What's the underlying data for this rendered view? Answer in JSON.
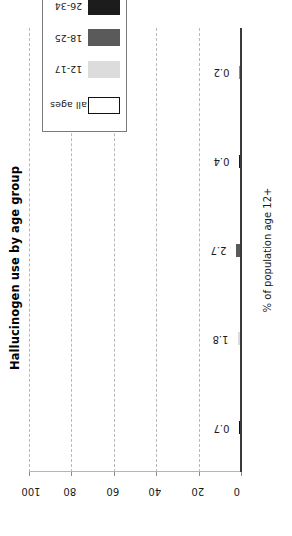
{
  "chart_data": {
    "type": "bar",
    "title": "Hallucinogen use by age group",
    "xlabel": "",
    "ylabel": "% of population age 12+",
    "orientation": "vertical-rotated",
    "categories": [
      "all ages",
      "12-17",
      "18-25",
      "26-34",
      "35+"
    ],
    "values": [
      0.7,
      1.8,
      2.7,
      0.4,
      0.2
    ],
    "value_labels": [
      "0.7",
      "1.8",
      "2.7",
      "0.4",
      "0.2"
    ],
    "ylim": [
      0,
      100
    ],
    "yticks": [
      0,
      20,
      40,
      60,
      80,
      100
    ],
    "ytick_labels": [
      "0",
      "20",
      "40",
      "60",
      "80",
      "100"
    ],
    "grid": true,
    "grid_style": "dashed",
    "legend_position": "top-right",
    "series": [
      {
        "name": "all ages",
        "value": 0.7,
        "color": "#ffffff",
        "edge": "#111111"
      },
      {
        "name": "12-17",
        "value": 1.8,
        "color": "#dcdcdc",
        "edge": "#dcdcdc"
      },
      {
        "name": "18-25",
        "value": 2.7,
        "color": "#5a5a5a",
        "edge": "#5a5a5a"
      },
      {
        "name": "26-34",
        "value": 0.4,
        "color": "#1c1c1c",
        "edge": "#1c1c1c"
      },
      {
        "name": "35+",
        "value": 0.2,
        "color": "#8e8e8e",
        "edge": "#8e8e8e"
      }
    ]
  },
  "legend": {
    "entries": [
      {
        "label": "all ages",
        "color": "#ffffff",
        "edge": "#111111"
      },
      {
        "label": "12-17",
        "color": "#dcdcdc",
        "edge": "#dcdcdc"
      },
      {
        "label": "18-25",
        "color": "#5a5a5a",
        "edge": "#5a5a5a"
      },
      {
        "label": "26-34",
        "color": "#1c1c1c",
        "edge": "#1c1c1c"
      },
      {
        "label": "35+",
        "color": "#8e8e8e",
        "edge": "#8e8e8e"
      }
    ]
  },
  "colors": {
    "axis": "#3a3a3a",
    "grid": "#b8b8b8",
    "text": "#1a1a1a",
    "background": "#ffffff"
  }
}
